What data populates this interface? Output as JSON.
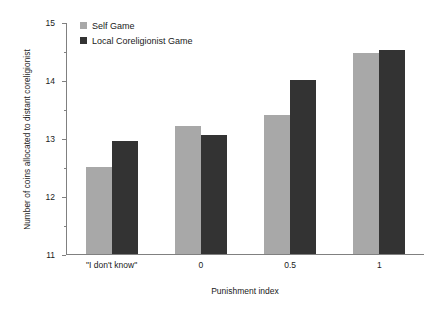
{
  "chart_data": {
    "type": "bar",
    "title": "",
    "xlabel": "Punishment index",
    "ylabel": "Number of coins allocated to distant coreligionist",
    "categories": [
      "\"I don't know\"",
      "0",
      "0.5",
      "1"
    ],
    "series": [
      {
        "name": "Self Game",
        "color": "#a8a8a8",
        "values": [
          12.5,
          13.2,
          13.4,
          14.47
        ]
      },
      {
        "name": "Local Coreligionist Game",
        "color": "#333333",
        "values": [
          12.95,
          13.05,
          14.0,
          14.52
        ]
      }
    ],
    "ylim": [
      11,
      15
    ],
    "yticks": [
      11,
      12,
      13,
      14,
      15
    ],
    "ytick_labels": [
      "11",
      "12",
      "13",
      "14",
      "15"
    ],
    "yminor_ticks": [
      11.5,
      12.5,
      13.5,
      14.5
    ],
    "grid": false,
    "legend_position": "top-left"
  },
  "legend": {
    "entries": [
      {
        "label": "Self Game"
      },
      {
        "label": "Local Coreligionist Game"
      }
    ]
  }
}
